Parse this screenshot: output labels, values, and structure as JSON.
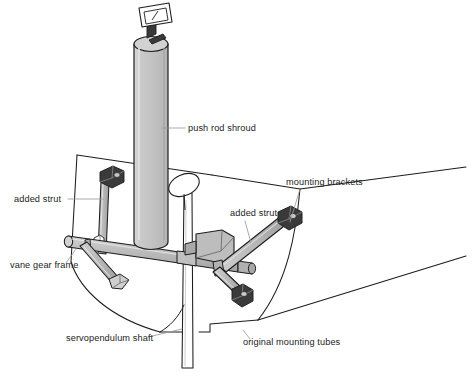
{
  "figure": {
    "kind": "technical-line-drawing",
    "background_color": "#ffffff",
    "line_color": "#1d1d1d",
    "text_color": "#1d1d1d",
    "leader_color": "#9a9a9a",
    "metal_fill": "#b4b4b4",
    "metal_fill_light": "#cfcfcf",
    "metal_fill_dark": "#9b9b9b",
    "shroud_fill": "#c3c3c3",
    "shroud_fill_light": "#d6d6d6",
    "bracket_fill": "#3a3a3a",
    "hull_fill": "#ffffff"
  },
  "labels": [
    {
      "id": "push-rod-shroud",
      "text": "push rod shroud",
      "x": 188,
      "y": 131,
      "anchor": "start",
      "leader": [
        [
          185,
          128
        ],
        [
          163,
          128
        ]
      ]
    },
    {
      "id": "mounting-brackets",
      "text": "mounting brackets",
      "x": 286,
      "y": 185,
      "anchor": "start",
      "leader": [
        [
          300,
          189
        ],
        [
          290,
          222
        ]
      ]
    },
    {
      "id": "added-strut-left",
      "text": "added strut",
      "x": 14,
      "y": 202,
      "anchor": "start",
      "leader": [
        [
          68,
          199
        ],
        [
          103,
          199
        ]
      ]
    },
    {
      "id": "added-strut-right",
      "text": "added strut",
      "x": 230,
      "y": 216,
      "anchor": "start",
      "leader": [
        [
          245,
          221
        ],
        [
          251,
          243
        ]
      ]
    },
    {
      "id": "vane-gear-frame",
      "text": "vane gear frame",
      "x": 10,
      "y": 268,
      "anchor": "start",
      "leader": [
        [
          66,
          263
        ],
        [
          76,
          249
        ]
      ]
    },
    {
      "id": "servopendulum-shaft",
      "text": "servopendulum shaft",
      "x": 66,
      "y": 341,
      "anchor": "start",
      "leader": [
        [
          148,
          337
        ],
        [
          182,
          329
        ]
      ]
    },
    {
      "id": "original-mounting-tubes",
      "text": "original mounting tubes",
      "x": 243,
      "y": 345,
      "anchor": "start",
      "leader": [
        [
          250,
          339
        ],
        [
          243,
          330
        ]
      ]
    }
  ],
  "parts": [
    {
      "id": "push-rod-shroud",
      "name": "push rod shroud",
      "description": "tall vertical cylindrical tube, center of drawing"
    },
    {
      "id": "vane-plate",
      "name": "vane plate",
      "description": "small rectangular plate on dark bracket at top of shroud"
    },
    {
      "id": "vane-gear-frame",
      "name": "vane gear frame",
      "description": "horizontal cross tube assembly"
    },
    {
      "id": "added-strut-left",
      "name": "added strut",
      "description": "vertical strut at left transom panel"
    },
    {
      "id": "added-strut-right",
      "name": "added strut",
      "description": "diagonal strut to upper right mounting bracket"
    },
    {
      "id": "mounting-brackets",
      "name": "mounting brackets",
      "description": "dark fittings bolted to transom"
    },
    {
      "id": "servopendulum-shaft",
      "name": "servopendulum shaft",
      "description": "thin vertical rod passing through hull bottom"
    },
    {
      "id": "original-mounting-tubes",
      "name": "original mounting tubes",
      "description": "original tube mounts at transom"
    },
    {
      "id": "servo-paddle",
      "name": "servo paddle",
      "description": "oval paddle at top of servopendulum shaft"
    }
  ]
}
